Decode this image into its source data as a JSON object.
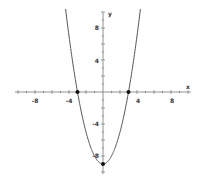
{
  "chart_data": {
    "type": "line",
    "title": "",
    "xlabel": "x",
    "ylabel": "y",
    "function": "y = x^2 - 9",
    "xlim": [
      -10.5,
      10
    ],
    "ylim": [
      -10,
      11
    ],
    "x_ticks": [
      -8,
      -4,
      4,
      8
    ],
    "y_ticks": [
      8,
      4,
      -4,
      -8
    ],
    "tick_step": 1,
    "grid": false,
    "series": [
      {
        "name": "parabola",
        "x": [
          -4.5,
          -4,
          -3,
          -2,
          -1,
          0,
          1,
          2,
          3,
          4,
          4.5
        ],
        "y": [
          11.25,
          7,
          0,
          -5,
          -8,
          -9,
          -8,
          -5,
          0,
          7,
          11.25
        ]
      }
    ],
    "points": [
      {
        "label": "root-left",
        "x": -3,
        "y": 0
      },
      {
        "label": "root-right",
        "x": 3,
        "y": 0
      },
      {
        "label": "vertex",
        "x": 0,
        "y": -9
      }
    ],
    "colors": {
      "curve": "#555555",
      "axis": "#666666",
      "point": "#111111"
    }
  },
  "labels": {
    "x_axis": "x",
    "y_axis": "y",
    "xt_m8": "-8",
    "xt_m4": "-4",
    "xt_4": "4",
    "xt_8": "8",
    "yt_8": "8",
    "yt_4": "4",
    "yt_m4": "-4",
    "yt_m8": "-8"
  }
}
